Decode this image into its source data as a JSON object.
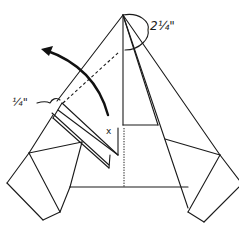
{
  "diagram": {
    "type": "origami-folding-step",
    "labels": {
      "top_measure": "2¼\"",
      "side_measure": "¼\"",
      "marker": "x"
    },
    "elements": {
      "fold_arrow": "curved-arrow-counterclockwise",
      "fold_line": "dashed-valley-fold",
      "center_line": "dotted-crease"
    },
    "colors": {
      "ink": "#1a1a1a",
      "paper": "#ffffff"
    }
  }
}
